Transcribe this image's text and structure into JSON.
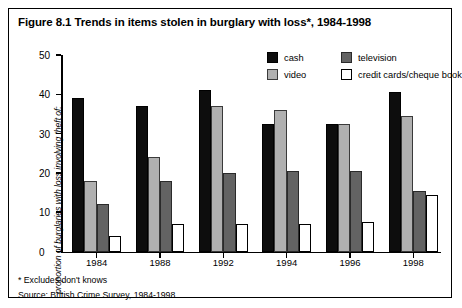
{
  "figure": {
    "title": "Figure 8.1 Trends in items stolen in burglary with loss*, 1984-1998",
    "footnote": "* Excludes don't knows",
    "source": "Source: British Crime Survey, 1984-1998"
  },
  "legend": {
    "position": "top-right",
    "items": [
      {
        "key": "cash",
        "label": "cash",
        "color": "#0d0d0d"
      },
      {
        "key": "television",
        "label": "television",
        "color": "#636363"
      },
      {
        "key": "video",
        "label": "video",
        "color": "#b0b0b0"
      },
      {
        "key": "credit",
        "label": "credit cards/cheque book",
        "color": "#ffffff"
      }
    ]
  },
  "axes": {
    "y_label": "proportion of burglaries with loss involving theft of:",
    "y_ticks": [
      "0",
      "10",
      "20",
      "30",
      "40",
      "50"
    ],
    "x_labels": [
      "1984",
      "1988",
      "1992",
      "1994",
      "1996",
      "1998"
    ]
  },
  "chart_data": {
    "type": "bar",
    "title": "Figure 8.1 Trends in items stolen in burglary with loss*, 1984-1998",
    "xlabel": "",
    "ylabel": "proportion of burglaries with loss involving theft of:",
    "categories": [
      "1984",
      "1988",
      "1992",
      "1994",
      "1996",
      "1998"
    ],
    "ylim": [
      0,
      50
    ],
    "yticks": [
      0,
      10,
      20,
      30,
      40,
      50
    ],
    "grid": false,
    "legend_position": "top-right",
    "series": [
      {
        "name": "cash",
        "color": "#0d0d0d",
        "values": [
          39,
          37,
          41,
          32.5,
          32.5,
          40.5
        ]
      },
      {
        "name": "video",
        "color": "#b0b0b0",
        "values": [
          18,
          24,
          37,
          36,
          32.5,
          34.5
        ]
      },
      {
        "name": "television",
        "color": "#636363",
        "values": [
          12,
          18,
          20,
          20.5,
          20.5,
          15.5
        ]
      },
      {
        "name": "credit cards/cheque book",
        "color": "#ffffff",
        "values": [
          4,
          7,
          7,
          7,
          7.5,
          14.5
        ]
      }
    ],
    "annotations": [
      "* Excludes don't knows",
      "Source: British Crime Survey, 1984-1998"
    ]
  }
}
